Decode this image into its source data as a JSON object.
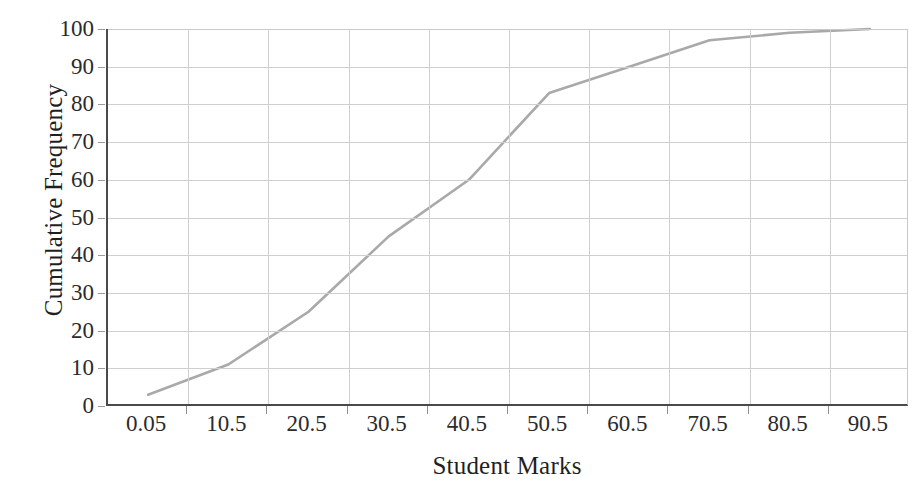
{
  "chart_data": {
    "type": "line",
    "title": "",
    "xlabel": "Student Marks",
    "ylabel": "Cumulative Frequency",
    "categories": [
      "0.05",
      "10.5",
      "20.5",
      "30.5",
      "40.5",
      "50.5",
      "60.5",
      "70.5",
      "80.5",
      "90.5"
    ],
    "values": [
      3,
      11,
      25,
      45,
      60,
      83,
      90,
      97,
      99,
      100
    ],
    "series": [
      {
        "name": "Cumulative Frequency",
        "values": [
          3,
          11,
          25,
          45,
          60,
          83,
          90,
          97,
          99,
          100
        ],
        "color": "#a9a9a9"
      }
    ],
    "ylim": [
      0,
      100
    ],
    "y_ticks": [
      0,
      10,
      20,
      30,
      40,
      50,
      60,
      70,
      80,
      90,
      100
    ],
    "y_tick_labels": [
      "0",
      "10",
      "20",
      "30",
      "40",
      "50",
      "60",
      "70",
      "80",
      "90",
      "100"
    ],
    "grid": "both",
    "legend": "none",
    "marker": "none",
    "line_color": "#a9a9a9",
    "gridline_color": "#cfcfcf",
    "axis_color": "#4a4a4a",
    "background": "#ffffff"
  }
}
